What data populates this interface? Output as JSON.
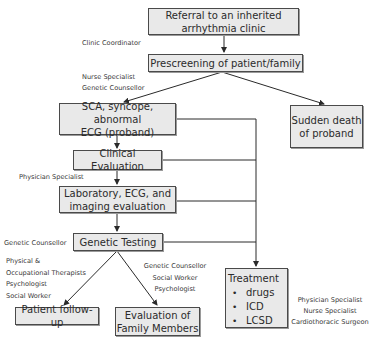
{
  "diagram": {
    "type": "flowchart",
    "nodes": {
      "referral": {
        "lines": [
          "Referral to an inherited",
          "arrhythmia clinic"
        ]
      },
      "prescreening": {
        "lines": [
          "Prescreening of patient/family"
        ]
      },
      "sca": {
        "lines": [
          "SCA, syncope, abnormal",
          "ECG (proband)"
        ]
      },
      "sudden_death": {
        "lines": [
          "Sudden death",
          "of proband"
        ]
      },
      "clinical": {
        "lines": [
          "Clinical Evaluation"
        ]
      },
      "laboratory": {
        "lines": [
          "Laboratory, ECG, and",
          "imaging evaluation"
        ]
      },
      "genetic_testing": {
        "lines": [
          "Genetic Testing"
        ]
      },
      "patient_followup": {
        "lines": [
          "Patient follow-up"
        ]
      },
      "family_eval": {
        "lines": [
          "Evaluation of",
          "Family Members"
        ]
      },
      "treatment": {
        "title": "Treatment",
        "items": [
          "drugs",
          "ICD",
          "LCSD"
        ]
      }
    },
    "roles": {
      "clinic_coordinator": [
        "Clinic Coordinator"
      ],
      "prescreen_staff": [
        "Nurse Specialist",
        "Genetic Counsellor"
      ],
      "physician": [
        "Physician Specialist"
      ],
      "genetic_counsellor": [
        "Genetic Counsellor"
      ],
      "followup_staff": [
        "Physical &",
        "Occupational Therapists",
        "Psychologist",
        "Social Worker"
      ],
      "family_staff": [
        "Genetic Counsellor",
        "Social Worker",
        "Psychologist"
      ],
      "treatment_staff": [
        "Physician Specialist",
        "Nurse Specialist",
        "Cardiothoracic Surgeon"
      ]
    },
    "edges": [
      [
        "referral",
        "prescreening"
      ],
      [
        "prescreening",
        "sca"
      ],
      [
        "prescreening",
        "sudden_death"
      ],
      [
        "sca",
        "clinical"
      ],
      [
        "clinical",
        "laboratory"
      ],
      [
        "laboratory",
        "genetic_testing"
      ],
      [
        "genetic_testing",
        "patient_followup"
      ],
      [
        "genetic_testing",
        "family_eval"
      ],
      [
        "sca",
        "treatment"
      ],
      [
        "clinical",
        "treatment"
      ],
      [
        "laboratory",
        "treatment"
      ],
      [
        "genetic_testing",
        "treatment"
      ]
    ]
  }
}
